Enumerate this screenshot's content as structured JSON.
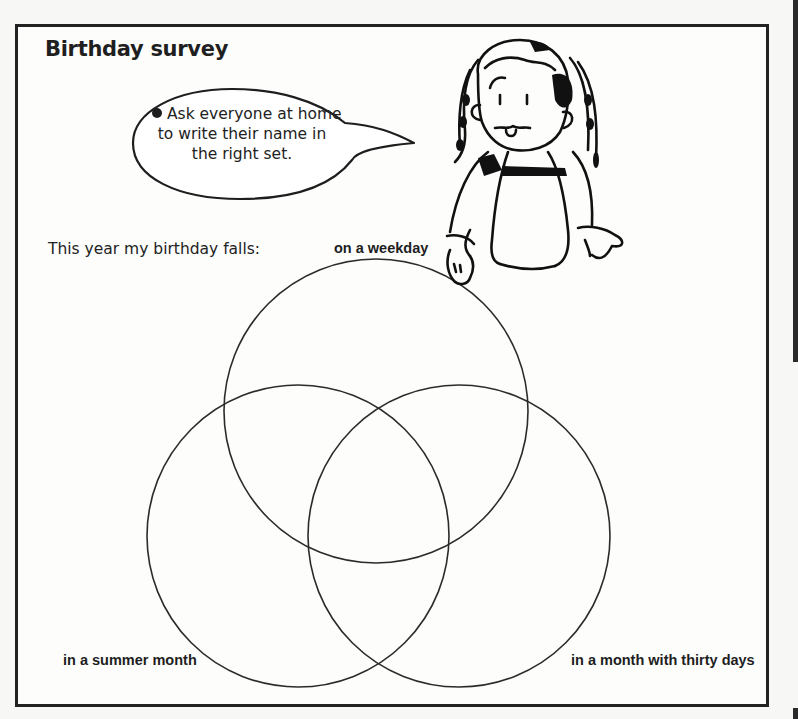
{
  "worksheet": {
    "title": "Birthday survey",
    "instruction": {
      "bullet_icon": "filled-circle-bullet",
      "lines": [
        "Ask everyone at home",
        "to write their name in",
        "the right set."
      ]
    },
    "intro_text": "This year my birthday falls:",
    "illustration": "girl-with-braids-leaning-on-diagram"
  },
  "venn": {
    "sets": [
      {
        "label": "on a weekday",
        "cx": 376,
        "cy": 411,
        "r": 152
      },
      {
        "label": "in a summer month",
        "cx": 298,
        "cy": 536,
        "r": 151
      },
      {
        "label": "in a month with thirty days",
        "cx": 459,
        "cy": 536,
        "r": 151
      }
    ],
    "line_color": "#2b2b2b"
  }
}
